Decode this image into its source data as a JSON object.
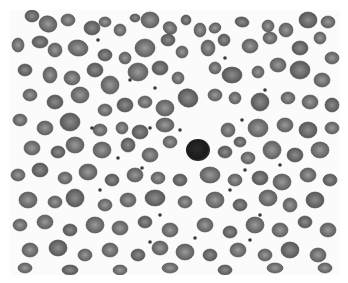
{
  "image": {
    "subject": "peripheral blood smear micrograph (grayscale)",
    "description": "Field of numerous red blood cells with a single dark-staining lymphocyte near the center",
    "background_color": "#fbfbfb",
    "border_color": "#ffffff"
  },
  "colors": {
    "rbc_dark": "#5a5a5a",
    "rbc_mid": "#6e6e6e",
    "rbc_light": "#858585",
    "rbc_center": "#9a9a9a",
    "lymphocyte": "#1c1c1c",
    "platelet": "#3a3a3a"
  },
  "lymphocyte": {
    "cx": 188,
    "cy": 140,
    "rx": 12,
    "ry": 11
  },
  "cells": [
    [
      22,
      6,
      7,
      6,
      0
    ],
    [
      38,
      14,
      9,
      8,
      20
    ],
    [
      58,
      10,
      7,
      6,
      0
    ],
    [
      82,
      18,
      8,
      7,
      0
    ],
    [
      95,
      12,
      6,
      5,
      0
    ],
    [
      110,
      20,
      6,
      6,
      0
    ],
    [
      125,
      8,
      5,
      4,
      0
    ],
    [
      140,
      10,
      9,
      8,
      0
    ],
    [
      160,
      18,
      7,
      6,
      30
    ],
    [
      176,
      10,
      5,
      5,
      0
    ],
    [
      190,
      20,
      6,
      7,
      0
    ],
    [
      205,
      18,
      6,
      5,
      -20
    ],
    [
      232,
      12,
      7,
      5,
      10
    ],
    [
      258,
      16,
      6,
      6,
      0
    ],
    [
      276,
      20,
      7,
      7,
      0
    ],
    [
      298,
      10,
      9,
      8,
      0
    ],
    [
      318,
      12,
      7,
      6,
      0
    ],
    [
      8,
      35,
      6,
      7,
      0
    ],
    [
      30,
      32,
      8,
      6,
      0
    ],
    [
      45,
      40,
      7,
      7,
      0
    ],
    [
      68,
      38,
      10,
      8,
      10
    ],
    [
      95,
      45,
      7,
      6,
      0
    ],
    [
      115,
      48,
      6,
      6,
      0
    ],
    [
      135,
      38,
      10,
      9,
      0
    ],
    [
      158,
      30,
      7,
      6,
      0
    ],
    [
      172,
      42,
      6,
      6,
      0
    ],
    [
      198,
      38,
      7,
      8,
      0
    ],
    [
      214,
      30,
      6,
      6,
      0
    ],
    [
      240,
      36,
      8,
      7,
      0
    ],
    [
      260,
      28,
      7,
      6,
      0
    ],
    [
      290,
      38,
      8,
      7,
      0
    ],
    [
      310,
      28,
      6,
      6,
      0
    ],
    [
      322,
      48,
      7,
      6,
      0
    ],
    [
      15,
      60,
      7,
      6,
      0
    ],
    [
      40,
      65,
      7,
      8,
      0
    ],
    [
      62,
      68,
      8,
      7,
      0
    ],
    [
      85,
      60,
      8,
      7,
      0
    ],
    [
      100,
      75,
      9,
      9,
      0
    ],
    [
      128,
      62,
      10,
      9,
      0
    ],
    [
      150,
      58,
      8,
      7,
      0
    ],
    [
      168,
      68,
      6,
      6,
      0
    ],
    [
      205,
      58,
      6,
      6,
      0
    ],
    [
      222,
      65,
      10,
      8,
      0
    ],
    [
      248,
      62,
      6,
      6,
      0
    ],
    [
      268,
      55,
      8,
      7,
      0
    ],
    [
      290,
      60,
      10,
      9,
      0
    ],
    [
      312,
      70,
      8,
      7,
      0
    ],
    [
      20,
      85,
      7,
      6,
      0
    ],
    [
      45,
      92,
      8,
      7,
      0
    ],
    [
      70,
      85,
      9,
      8,
      0
    ],
    [
      95,
      100,
      7,
      6,
      0
    ],
    [
      115,
      95,
      8,
      7,
      0
    ],
    [
      135,
      92,
      7,
      6,
      0
    ],
    [
      155,
      98,
      9,
      8,
      0
    ],
    [
      178,
      88,
      10,
      9,
      20
    ],
    [
      205,
      85,
      7,
      6,
      0
    ],
    [
      225,
      88,
      6,
      6,
      0
    ],
    [
      250,
      92,
      9,
      9,
      0
    ],
    [
      278,
      88,
      7,
      6,
      0
    ],
    [
      300,
      92,
      8,
      7,
      0
    ],
    [
      322,
      95,
      7,
      7,
      0
    ],
    [
      10,
      110,
      7,
      6,
      0
    ],
    [
      35,
      118,
      8,
      7,
      0
    ],
    [
      60,
      112,
      10,
      9,
      0
    ],
    [
      90,
      120,
      7,
      6,
      0
    ],
    [
      112,
      118,
      6,
      6,
      0
    ],
    [
      130,
      122,
      8,
      7,
      0
    ],
    [
      155,
      115,
      9,
      7,
      0
    ],
    [
      218,
      120,
      7,
      7,
      0
    ],
    [
      230,
      132,
      6,
      5,
      0
    ],
    [
      248,
      118,
      10,
      9,
      0
    ],
    [
      275,
      115,
      8,
      7,
      0
    ],
    [
      298,
      120,
      9,
      8,
      0
    ],
    [
      322,
      118,
      7,
      6,
      0
    ],
    [
      22,
      138,
      8,
      7,
      0
    ],
    [
      48,
      142,
      7,
      6,
      0
    ],
    [
      65,
      135,
      9,
      8,
      0
    ],
    [
      92,
      140,
      9,
      8,
      0
    ],
    [
      118,
      135,
      7,
      7,
      0
    ],
    [
      140,
      145,
      8,
      7,
      0
    ],
    [
      160,
      132,
      7,
      6,
      0
    ],
    [
      215,
      142,
      7,
      6,
      0
    ],
    [
      238,
      148,
      7,
      6,
      0
    ],
    [
      262,
      140,
      9,
      9,
      0
    ],
    [
      285,
      145,
      8,
      7,
      0
    ],
    [
      310,
      140,
      9,
      8,
      0
    ],
    [
      8,
      165,
      7,
      6,
      0
    ],
    [
      30,
      160,
      8,
      7,
      0
    ],
    [
      55,
      168,
      7,
      6,
      0
    ],
    [
      78,
      162,
      9,
      8,
      0
    ],
    [
      102,
      170,
      7,
      6,
      0
    ],
    [
      125,
      165,
      8,
      7,
      0
    ],
    [
      148,
      168,
      7,
      6,
      0
    ],
    [
      170,
      170,
      7,
      6,
      0
    ],
    [
      200,
      165,
      10,
      8,
      0
    ],
    [
      225,
      170,
      7,
      6,
      0
    ],
    [
      250,
      168,
      8,
      7,
      0
    ],
    [
      272,
      172,
      9,
      8,
      0
    ],
    [
      298,
      165,
      8,
      7,
      0
    ],
    [
      320,
      170,
      7,
      6,
      0
    ],
    [
      18,
      190,
      9,
      8,
      0
    ],
    [
      45,
      192,
      7,
      6,
      0
    ],
    [
      65,
      188,
      9,
      9,
      0
    ],
    [
      95,
      195,
      7,
      6,
      0
    ],
    [
      118,
      190,
      8,
      7,
      0
    ],
    [
      145,
      188,
      10,
      8,
      0
    ],
    [
      175,
      192,
      7,
      6,
      0
    ],
    [
      205,
      190,
      9,
      8,
      0
    ],
    [
      230,
      195,
      7,
      6,
      0
    ],
    [
      258,
      188,
      9,
      8,
      0
    ],
    [
      280,
      195,
      7,
      7,
      0
    ],
    [
      305,
      190,
      9,
      8,
      0
    ],
    [
      10,
      215,
      7,
      6,
      0
    ],
    [
      35,
      212,
      8,
      7,
      0
    ],
    [
      60,
      220,
      7,
      6,
      0
    ],
    [
      85,
      215,
      9,
      8,
      0
    ],
    [
      110,
      218,
      8,
      7,
      0
    ],
    [
      135,
      212,
      7,
      6,
      0
    ],
    [
      160,
      220,
      8,
      7,
      0
    ],
    [
      195,
      215,
      8,
      7,
      0
    ],
    [
      220,
      222,
      7,
      6,
      0
    ],
    [
      245,
      215,
      9,
      8,
      0
    ],
    [
      270,
      220,
      8,
      7,
      0
    ],
    [
      295,
      212,
      7,
      6,
      0
    ],
    [
      318,
      220,
      8,
      7,
      0
    ],
    [
      20,
      240,
      8,
      7,
      0
    ],
    [
      48,
      238,
      9,
      8,
      0
    ],
    [
      75,
      245,
      7,
      6,
      0
    ],
    [
      100,
      240,
      8,
      7,
      0
    ],
    [
      128,
      245,
      7,
      6,
      0
    ],
    [
      150,
      238,
      8,
      7,
      0
    ],
    [
      175,
      242,
      9,
      8,
      0
    ],
    [
      200,
      245,
      7,
      6,
      0
    ],
    [
      228,
      240,
      8,
      7,
      0
    ],
    [
      255,
      245,
      7,
      6,
      0
    ],
    [
      280,
      240,
      9,
      8,
      0
    ],
    [
      308,
      245,
      8,
      7,
      0
    ],
    [
      15,
      258,
      7,
      5,
      0
    ],
    [
      60,
      260,
      8,
      5,
      0
    ],
    [
      110,
      260,
      7,
      5,
      0
    ],
    [
      160,
      258,
      8,
      5,
      0
    ],
    [
      215,
      260,
      7,
      5,
      0
    ],
    [
      265,
      258,
      8,
      5,
      0
    ],
    [
      315,
      258,
      7,
      5,
      0
    ]
  ],
  "platelets": [
    [
      88,
      30
    ],
    [
      120,
      70
    ],
    [
      145,
      78
    ],
    [
      215,
      48
    ],
    [
      255,
      80
    ],
    [
      82,
      118
    ],
    [
      140,
      118
    ],
    [
      170,
      120
    ],
    [
      232,
      110
    ],
    [
      108,
      148
    ],
    [
      132,
      158
    ],
    [
      235,
      160
    ],
    [
      270,
      155
    ],
    [
      90,
      180
    ],
    [
      220,
      180
    ],
    [
      150,
      205
    ],
    [
      250,
      205
    ],
    [
      185,
      228
    ],
    [
      240,
      230
    ],
    [
      140,
      232
    ]
  ]
}
